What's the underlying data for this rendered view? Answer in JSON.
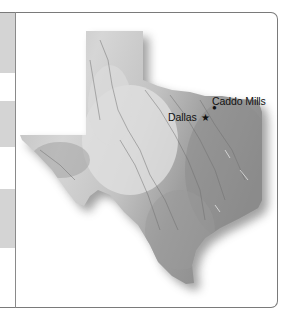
{
  "map": {
    "region": "Texas",
    "style": "grayscale shaded relief",
    "colors": {
      "frame_border": "#7a7a7a",
      "stripe_gray": "#d4d4d4",
      "stripe_white": "#ffffff",
      "relief_light": "#d9d9d9",
      "relief_mid": "#b3b3b3",
      "relief_dark": "#8f8f8f",
      "shadow": "#555555",
      "label_text": "#111111"
    },
    "markers": [
      {
        "name": "Dallas",
        "symbol": "star-icon",
        "glyph": "★",
        "label": "Dallas"
      },
      {
        "name": "Caddo Mills",
        "symbol": "dot-icon",
        "glyph": "●",
        "label": "Caddo Mills"
      }
    ]
  },
  "sidebar": {
    "stripes": [
      {
        "color": "gray",
        "top": 0,
        "height": 60
      },
      {
        "color": "white",
        "top": 60,
        "height": 28
      },
      {
        "color": "gray",
        "top": 88,
        "height": 46
      },
      {
        "color": "white",
        "top": 134,
        "height": 42
      },
      {
        "color": "gray",
        "top": 176,
        "height": 59
      },
      {
        "color": "white",
        "top": 235,
        "height": 59
      }
    ]
  }
}
